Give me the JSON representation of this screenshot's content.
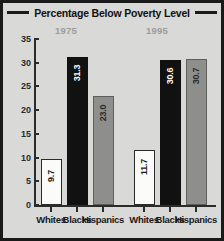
{
  "chart_data": {
    "type": "bar",
    "title": "Percentage Below Poverty Level",
    "xlabel": "",
    "ylabel": "",
    "ylim": [
      0,
      35
    ],
    "ytick_labels": [
      "35",
      "30",
      "25",
      "20",
      "15",
      "10",
      "5",
      "0"
    ],
    "ytick_values": [
      35,
      30,
      25,
      20,
      15,
      10,
      5,
      0
    ],
    "grid": false,
    "legend_position": "none",
    "groups": [
      "1975",
      "1995"
    ],
    "categories": [
      "Whites",
      "Blacks",
      "Hispanics"
    ],
    "series": [
      {
        "name": "1975",
        "values": [
          9.7,
          31.3,
          23.0
        ]
      },
      {
        "name": "1995",
        "values": [
          11.7,
          30.6,
          30.7
        ]
      }
    ],
    "bars": [
      {
        "group": "1975",
        "category": "Whites",
        "value": 9.7,
        "label": "9.7",
        "style": "white-bar"
      },
      {
        "group": "1975",
        "category": "Blacks",
        "value": 31.3,
        "label": "31.3",
        "style": "black-bar"
      },
      {
        "group": "1975",
        "category": "Hispanics",
        "value": 23.0,
        "label": "23.0",
        "style": "gray-bar"
      },
      {
        "group": "1995",
        "category": "Whites",
        "value": 11.7,
        "label": "11.7",
        "style": "white-bar"
      },
      {
        "group": "1995",
        "category": "Blacks",
        "value": 30.6,
        "label": "30.6",
        "style": "black-bar"
      },
      {
        "group": "1995",
        "category": "Hispanics",
        "value": 30.7,
        "label": "30.7",
        "style": "gray-bar"
      }
    ],
    "colors": {
      "whites_bar": "#fbfbfa",
      "blacks_bar": "#111111",
      "hispanics_bar": "#8e8e8c",
      "panel_background": "#d9d9d7",
      "frame": "#1a1a1a",
      "axis": "#2b2b2b",
      "group_label": "#9d9d9b",
      "title_text": "#111111"
    }
  }
}
